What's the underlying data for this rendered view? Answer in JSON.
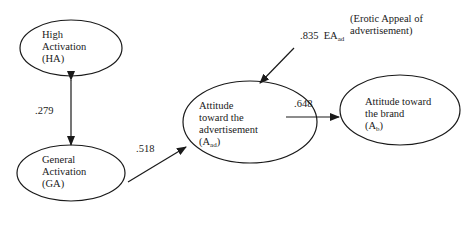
{
  "nodes": {
    "ha": {
      "line1": "High",
      "line2": "Activation",
      "line3": "(HA)"
    },
    "ga": {
      "line1": "General",
      "line2": "Activation",
      "line3": "(GA)"
    },
    "aad": {
      "line1": "Attitude",
      "line2": "toward the",
      "line3": "advertisement",
      "line4_main": "(A",
      "line4_sub": "ad",
      "line4_end": ")"
    },
    "ab": {
      "line1": "Attitude toward",
      "line2": "the brand",
      "line3_main": "(A",
      "line3_sub": "b",
      "line3_end": ")"
    }
  },
  "edges": {
    "ha_ga": {
      "coef": ".279"
    },
    "ga_aad": {
      "coef": ".518"
    },
    "aad_ab": {
      "coef": ".648"
    },
    "ea_aad": {
      "coef": ".835",
      "var_main": "EA",
      "var_sub": "ad"
    }
  },
  "annotation": {
    "line1": "(Erotic Appeal of",
    "line2": "advertisement)"
  },
  "colors": {
    "line": "#1a1a1a",
    "background": "#ffffff"
  }
}
